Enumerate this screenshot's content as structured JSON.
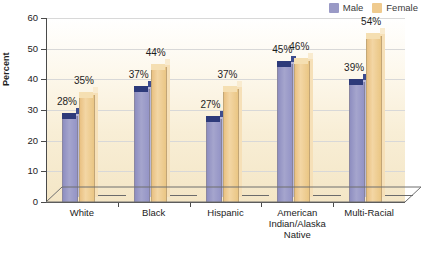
{
  "chart_data": {
    "type": "bar",
    "title": "",
    "xlabel": "",
    "ylabel": "Percent",
    "ylim": [
      0,
      60
    ],
    "ytick_step": 10,
    "yticks": [
      "60",
      "50",
      "40",
      "30",
      "20",
      "10",
      "0"
    ],
    "grid": true,
    "legend_position": "top-right",
    "categories": [
      "White",
      "Black",
      "Hispanic",
      "American\nIndian/Alaska\nNative",
      "Multi-Racial"
    ],
    "series": [
      {
        "name": "Male",
        "color": "#9a9ac6",
        "values": [
          28,
          37,
          27,
          45,
          39
        ],
        "labels": [
          "28%",
          "37%",
          "27%",
          "45%",
          "39%"
        ]
      },
      {
        "name": "Female",
        "color": "#efca8e",
        "values": [
          35,
          44,
          37,
          46,
          54
        ],
        "labels": [
          "35%",
          "44%",
          "37%",
          "46%",
          "54%"
        ]
      }
    ]
  },
  "legend": {
    "male_label": "Male",
    "female_label": "Female"
  },
  "axis": {
    "y_title": "Percent"
  }
}
